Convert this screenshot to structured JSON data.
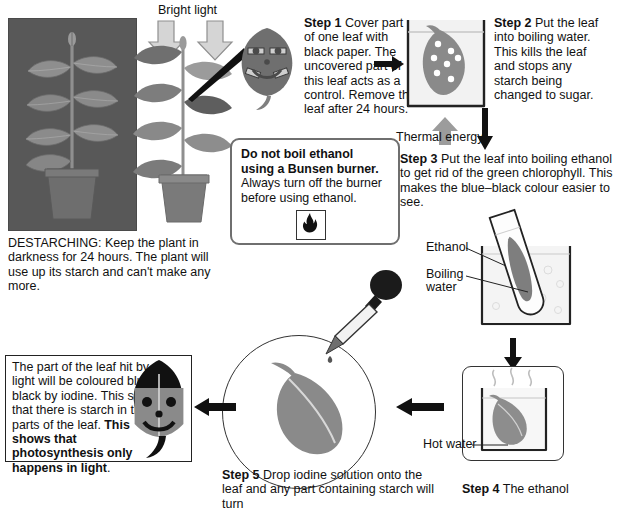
{
  "diagram": {
    "labels": {
      "bright_light": "Bright light",
      "thermal_energy": "Thermal energy",
      "ethanol": "Ethanol",
      "boiling_water": "Boiling water",
      "hot_water": "Hot water"
    },
    "captions": {
      "destarching": "DESTARCHING: Keep the plant in darkness for 24 hours. The plant will use up its starch and can't make any more."
    },
    "steps": [
      {
        "id": "step1",
        "label": "Step 1",
        "text": " Cover part of one leaf with black paper. The uncovered part of this leaf acts as a control. Remove the leaf after 24 hours."
      },
      {
        "id": "step2",
        "label": "Step 2",
        "text": " Put the leaf into boiling water. This kills the leaf and stops any starch being changed to sugar."
      },
      {
        "id": "step3",
        "label": "Step 3",
        "text": " Put the leaf into boiling ethanol to get rid of the green chlorophyll. This makes the blue–black colour easier to see."
      },
      {
        "id": "step4",
        "label": "Step 4",
        "text": " The ethanol"
      },
      {
        "id": "step5",
        "label": "Step 5",
        "text": " Drop iodine solution onto the leaf and any part containing starch will turn"
      }
    ],
    "warning": {
      "line1": "Do not boil ethanol",
      "line2": "using a Bunsen burner.",
      "line3": "Always turn off the burner",
      "line4": "before using ethanol.",
      "icon": "flammable-hazard-icon"
    },
    "result": {
      "text": "The part of the leaf hit by light will be coloured blue–black by iodine. This shows that there is starch in those parts of the leaf. ",
      "bold": "This shows that photosynthesis only happens in light",
      "tail": "."
    },
    "colors": {
      "leaf_gray": "#8a8a8a",
      "leaf_gray_dark": "#767676",
      "photo_bg": "#585858",
      "arrow_black": "#111111",
      "arrow_gray": "#9c9c9c",
      "outline": "#222222",
      "warn_border": "#6f6f6f"
    }
  }
}
